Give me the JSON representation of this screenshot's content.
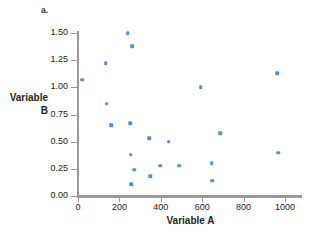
{
  "figure": {
    "panel_label": "a.",
    "top_cut_text": "",
    "marker_color": "#5b8fc9",
    "axis_color": "#9a9a9a"
  },
  "chart_data": {
    "type": "scatter",
    "title": "",
    "xlabel": "Variable A",
    "ylabel": "Variable B",
    "ylabel_lines": [
      "Variable",
      "B"
    ],
    "xlim": [
      0,
      1100
    ],
    "ylim": [
      0.0,
      1.5
    ],
    "xticks": [
      0,
      200,
      400,
      600,
      800,
      1000
    ],
    "xtick_labels": [
      "0",
      "200",
      "400",
      "600",
      "800",
      "1000"
    ],
    "yticks": [
      0.0,
      0.25,
      0.5,
      0.75,
      1.0,
      1.25,
      1.5
    ],
    "ytick_labels": [
      "0.00",
      "0.25",
      "0.50",
      "0.75",
      "1.00",
      "1.25",
      "1.50"
    ],
    "grid": false,
    "legend": null,
    "series": [
      {
        "name": "Variable A vs Variable B",
        "color": "#5b8fc9",
        "points": [
          {
            "x": 20,
            "y": 1.07
          },
          {
            "x": 135,
            "y": 1.22
          },
          {
            "x": 240,
            "y": 1.5
          },
          {
            "x": 262,
            "y": 1.38
          },
          {
            "x": 138,
            "y": 0.85
          },
          {
            "x": 160,
            "y": 0.65
          },
          {
            "x": 252,
            "y": 0.67
          },
          {
            "x": 255,
            "y": 0.38
          },
          {
            "x": 272,
            "y": 0.24
          },
          {
            "x": 258,
            "y": 0.11
          },
          {
            "x": 345,
            "y": 0.53
          },
          {
            "x": 350,
            "y": 0.18
          },
          {
            "x": 398,
            "y": 0.28
          },
          {
            "x": 437,
            "y": 0.5
          },
          {
            "x": 490,
            "y": 0.28
          },
          {
            "x": 592,
            "y": 1.0
          },
          {
            "x": 645,
            "y": 0.3
          },
          {
            "x": 648,
            "y": 0.14
          },
          {
            "x": 688,
            "y": 0.58
          },
          {
            "x": 963,
            "y": 1.13
          },
          {
            "x": 968,
            "y": 0.4
          }
        ]
      }
    ]
  }
}
